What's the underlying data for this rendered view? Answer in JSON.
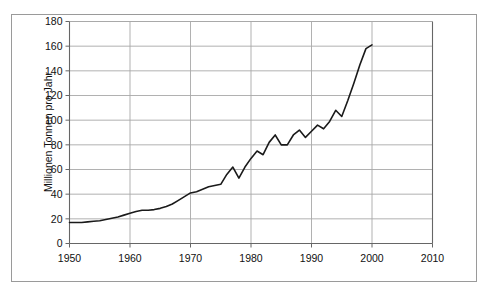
{
  "chart_data": {
    "type": "line",
    "title": "",
    "xlabel": "",
    "ylabel": "Millionen Tonnen pro Jahr",
    "xlim": [
      1950,
      2010
    ],
    "ylim": [
      0,
      180
    ],
    "xticks": [
      "1950",
      "1960",
      "1970",
      "1980",
      "1990",
      "2000",
      "2010"
    ],
    "yticks": [
      "0",
      "20",
      "40",
      "60",
      "80",
      "100",
      "120",
      "140",
      "160",
      "180"
    ],
    "grid": true,
    "legend": "none",
    "line_color": "#1a1a1a",
    "grid_color": "#a8a8a8",
    "frame_color": "#666666",
    "series": [
      {
        "name": "Produktion",
        "x": [
          1950,
          1951,
          1952,
          1953,
          1954,
          1955,
          1956,
          1957,
          1958,
          1959,
          1960,
          1961,
          1962,
          1963,
          1964,
          1965,
          1966,
          1967,
          1968,
          1969,
          1970,
          1971,
          1972,
          1973,
          1974,
          1975,
          1976,
          1977,
          1978,
          1979,
          1980,
          1981,
          1982,
          1983,
          1984,
          1985,
          1986,
          1987,
          1988,
          1989,
          1990,
          1991,
          1992,
          1993,
          1994,
          1995,
          1996,
          1997,
          1998,
          1999,
          2000
        ],
        "values": [
          17,
          17,
          17,
          17.5,
          18,
          18.5,
          19.5,
          20.5,
          21.5,
          23,
          24.5,
          26,
          27,
          27,
          27.5,
          28.5,
          30,
          32,
          35,
          38,
          41,
          42,
          44,
          46,
          47,
          48,
          56,
          62,
          53,
          62,
          69,
          75,
          72,
          82,
          88,
          80,
          80,
          88,
          92,
          86,
          91,
          96,
          93,
          99,
          108,
          103,
          116,
          130,
          145,
          158,
          161
        ]
      }
    ]
  },
  "axis": {
    "y_label": "Millionen Tonnen pro Jahr"
  }
}
